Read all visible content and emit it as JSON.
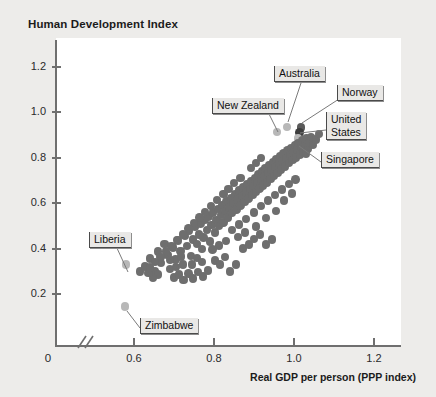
{
  "chart_data": {
    "type": "scatter",
    "title": "Human Development Index",
    "ylabel": "Human Development Index",
    "xlabel": "Real GDP per person (PPP index)",
    "xticks": [
      0.6,
      0.8,
      1.0,
      1.2
    ],
    "xtick_labels": [
      "0.6",
      "0.8",
      "1.0",
      "1.2"
    ],
    "x_origin_label": "0",
    "yticks": [
      0.2,
      0.4,
      0.6,
      0.8,
      1.0,
      1.2
    ],
    "ytick_labels": [
      "0.2",
      "0.4",
      "0.6",
      "0.8",
      "1.0",
      "1.2"
    ],
    "xlim": [
      0.52,
      1.3
    ],
    "ylim": [
      0.0,
      1.3
    ],
    "axis_break": true,
    "grid": false,
    "legend": "none",
    "marker_color": "#6e6e6e",
    "highlight_color": "#3d3d3d",
    "light_marker_color": "#b8b8b8",
    "annotations": [
      {
        "label": "Australia",
        "x": 0.983,
        "y": 0.936
      },
      {
        "label": "Norway",
        "x": 1.018,
        "y": 0.934
      },
      {
        "label": "New Zealand",
        "x": 0.957,
        "y": 0.914
      },
      {
        "label": "United States",
        "x": 1.013,
        "y": 0.913
      },
      {
        "label": "Singapore",
        "x": 1.01,
        "y": 0.885
      },
      {
        "label": "Liberia",
        "x": 0.58,
        "y": 0.33
      },
      {
        "label": "Zimbabwe",
        "x": 0.578,
        "y": 0.145
      }
    ],
    "points": [
      {
        "x": 0.58,
        "y": 0.33,
        "hl": "light"
      },
      {
        "x": 0.578,
        "y": 0.145,
        "hl": "light"
      },
      {
        "x": 0.983,
        "y": 0.936,
        "hl": "light"
      },
      {
        "x": 1.018,
        "y": 0.934,
        "hl": "dark"
      },
      {
        "x": 0.957,
        "y": 0.914,
        "hl": "light"
      },
      {
        "x": 1.013,
        "y": 0.913,
        "hl": "darker"
      },
      {
        "x": 1.01,
        "y": 0.885,
        "hl": "light"
      },
      {
        "x": 0.615,
        "y": 0.3
      },
      {
        "x": 0.628,
        "y": 0.322
      },
      {
        "x": 0.64,
        "y": 0.356
      },
      {
        "x": 0.652,
        "y": 0.3
      },
      {
        "x": 0.66,
        "y": 0.388
      },
      {
        "x": 0.668,
        "y": 0.336
      },
      {
        "x": 0.676,
        "y": 0.42
      },
      {
        "x": 0.684,
        "y": 0.372
      },
      {
        "x": 0.69,
        "y": 0.31
      },
      {
        "x": 0.698,
        "y": 0.404
      },
      {
        "x": 0.704,
        "y": 0.352
      },
      {
        "x": 0.71,
        "y": 0.436
      },
      {
        "x": 0.716,
        "y": 0.39
      },
      {
        "x": 0.722,
        "y": 0.33
      },
      {
        "x": 0.728,
        "y": 0.455
      },
      {
        "x": 0.733,
        "y": 0.412
      },
      {
        "x": 0.738,
        "y": 0.478
      },
      {
        "x": 0.742,
        "y": 0.368
      },
      {
        "x": 0.747,
        "y": 0.44
      },
      {
        "x": 0.752,
        "y": 0.495
      },
      {
        "x": 0.757,
        "y": 0.42
      },
      {
        "x": 0.762,
        "y": 0.463
      },
      {
        "x": 0.766,
        "y": 0.51
      },
      {
        "x": 0.77,
        "y": 0.398
      },
      {
        "x": 0.774,
        "y": 0.448
      },
      {
        "x": 0.778,
        "y": 0.528
      },
      {
        "x": 0.782,
        "y": 0.482
      },
      {
        "x": 0.786,
        "y": 0.542
      },
      {
        "x": 0.79,
        "y": 0.432
      },
      {
        "x": 0.794,
        "y": 0.505
      },
      {
        "x": 0.798,
        "y": 0.56
      },
      {
        "x": 0.802,
        "y": 0.47
      },
      {
        "x": 0.806,
        "y": 0.525
      },
      {
        "x": 0.81,
        "y": 0.575
      },
      {
        "x": 0.813,
        "y": 0.5
      },
      {
        "x": 0.817,
        "y": 0.548
      },
      {
        "x": 0.82,
        "y": 0.592
      },
      {
        "x": 0.824,
        "y": 0.515
      },
      {
        "x": 0.828,
        "y": 0.566
      },
      {
        "x": 0.831,
        "y": 0.608
      },
      {
        "x": 0.835,
        "y": 0.538
      },
      {
        "x": 0.838,
        "y": 0.582
      },
      {
        "x": 0.842,
        "y": 0.624
      },
      {
        "x": 0.845,
        "y": 0.556
      },
      {
        "x": 0.849,
        "y": 0.6
      },
      {
        "x": 0.852,
        "y": 0.64
      },
      {
        "x": 0.856,
        "y": 0.572
      },
      {
        "x": 0.859,
        "y": 0.616
      },
      {
        "x": 0.863,
        "y": 0.655
      },
      {
        "x": 0.866,
        "y": 0.59
      },
      {
        "x": 0.87,
        "y": 0.632
      },
      {
        "x": 0.873,
        "y": 0.67
      },
      {
        "x": 0.876,
        "y": 0.606
      },
      {
        "x": 0.88,
        "y": 0.648
      },
      {
        "x": 0.883,
        "y": 0.684
      },
      {
        "x": 0.886,
        "y": 0.62
      },
      {
        "x": 0.89,
        "y": 0.662
      },
      {
        "x": 0.893,
        "y": 0.698
      },
      {
        "x": 0.896,
        "y": 0.636
      },
      {
        "x": 0.899,
        "y": 0.676
      },
      {
        "x": 0.902,
        "y": 0.712
      },
      {
        "x": 0.905,
        "y": 0.65
      },
      {
        "x": 0.908,
        "y": 0.69
      },
      {
        "x": 0.911,
        "y": 0.726
      },
      {
        "x": 0.914,
        "y": 0.664
      },
      {
        "x": 0.917,
        "y": 0.704
      },
      {
        "x": 0.92,
        "y": 0.74
      },
      {
        "x": 0.923,
        "y": 0.678
      },
      {
        "x": 0.926,
        "y": 0.718
      },
      {
        "x": 0.929,
        "y": 0.754
      },
      {
        "x": 0.932,
        "y": 0.692
      },
      {
        "x": 0.935,
        "y": 0.732
      },
      {
        "x": 0.938,
        "y": 0.768
      },
      {
        "x": 0.941,
        "y": 0.706
      },
      {
        "x": 0.944,
        "y": 0.746
      },
      {
        "x": 0.947,
        "y": 0.782
      },
      {
        "x": 0.95,
        "y": 0.72
      },
      {
        "x": 0.953,
        "y": 0.76
      },
      {
        "x": 0.956,
        "y": 0.795
      },
      {
        "x": 0.959,
        "y": 0.734
      },
      {
        "x": 0.962,
        "y": 0.774
      },
      {
        "x": 0.965,
        "y": 0.808
      },
      {
        "x": 0.968,
        "y": 0.748
      },
      {
        "x": 0.971,
        "y": 0.788
      },
      {
        "x": 0.974,
        "y": 0.82
      },
      {
        "x": 0.977,
        "y": 0.762
      },
      {
        "x": 0.98,
        "y": 0.8
      },
      {
        "x": 0.984,
        "y": 0.832
      },
      {
        "x": 0.987,
        "y": 0.776
      },
      {
        "x": 0.99,
        "y": 0.812
      },
      {
        "x": 0.993,
        "y": 0.844
      },
      {
        "x": 0.996,
        "y": 0.79
      },
      {
        "x": 0.999,
        "y": 0.824
      },
      {
        "x": 1.002,
        "y": 0.856
      },
      {
        "x": 1.005,
        "y": 0.802
      },
      {
        "x": 1.008,
        "y": 0.836
      },
      {
        "x": 1.011,
        "y": 0.866
      },
      {
        "x": 1.015,
        "y": 0.814
      },
      {
        "x": 1.018,
        "y": 0.848
      },
      {
        "x": 1.021,
        "y": 0.876
      },
      {
        "x": 1.024,
        "y": 0.826
      },
      {
        "x": 1.028,
        "y": 0.858
      },
      {
        "x": 1.031,
        "y": 0.884
      },
      {
        "x": 1.035,
        "y": 0.838
      },
      {
        "x": 1.039,
        "y": 0.868
      },
      {
        "x": 1.043,
        "y": 0.892
      },
      {
        "x": 0.9,
        "y": 0.56
      },
      {
        "x": 0.918,
        "y": 0.588
      },
      {
        "x": 0.935,
        "y": 0.612
      },
      {
        "x": 0.952,
        "y": 0.636
      },
      {
        "x": 0.88,
        "y": 0.53
      },
      {
        "x": 0.862,
        "y": 0.506
      },
      {
        "x": 0.845,
        "y": 0.482
      },
      {
        "x": 0.97,
        "y": 0.66
      },
      {
        "x": 0.988,
        "y": 0.684
      },
      {
        "x": 1.004,
        "y": 0.705
      },
      {
        "x": 0.86,
        "y": 0.452
      },
      {
        "x": 0.878,
        "y": 0.47
      },
      {
        "x": 0.905,
        "y": 0.498
      },
      {
        "x": 0.83,
        "y": 0.434
      },
      {
        "x": 0.812,
        "y": 0.414
      },
      {
        "x": 0.796,
        "y": 0.396
      },
      {
        "x": 0.955,
        "y": 0.565
      },
      {
        "x": 0.93,
        "y": 0.534
      },
      {
        "x": 0.7,
        "y": 0.272
      },
      {
        "x": 0.712,
        "y": 0.286
      },
      {
        "x": 0.724,
        "y": 0.262
      },
      {
        "x": 0.736,
        "y": 0.29
      },
      {
        "x": 0.748,
        "y": 0.268
      },
      {
        "x": 0.76,
        "y": 0.296
      },
      {
        "x": 0.772,
        "y": 0.276
      },
      {
        "x": 0.785,
        "y": 0.304
      },
      {
        "x": 0.66,
        "y": 0.286
      },
      {
        "x": 0.648,
        "y": 0.27
      },
      {
        "x": 0.636,
        "y": 0.292
      },
      {
        "x": 0.69,
        "y": 0.35
      },
      {
        "x": 0.705,
        "y": 0.32
      },
      {
        "x": 0.718,
        "y": 0.365
      },
      {
        "x": 0.745,
        "y": 0.33
      },
      {
        "x": 0.758,
        "y": 0.358
      },
      {
        "x": 0.77,
        "y": 0.34
      },
      {
        "x": 0.802,
        "y": 0.348
      },
      {
        "x": 0.815,
        "y": 0.33
      },
      {
        "x": 0.828,
        "y": 0.362
      },
      {
        "x": 0.84,
        "y": 0.3
      },
      {
        "x": 0.855,
        "y": 0.33
      },
      {
        "x": 0.872,
        "y": 0.4
      },
      {
        "x": 0.888,
        "y": 0.418
      },
      {
        "x": 0.9,
        "y": 0.442
      },
      {
        "x": 0.915,
        "y": 0.462
      },
      {
        "x": 0.93,
        "y": 0.418
      },
      {
        "x": 0.945,
        "y": 0.44
      },
      {
        "x": 0.975,
        "y": 0.612
      },
      {
        "x": 0.995,
        "y": 0.642
      },
      {
        "x": 1.03,
        "y": 0.82
      },
      {
        "x": 1.048,
        "y": 0.856
      },
      {
        "x": 1.055,
        "y": 0.88
      },
      {
        "x": 1.062,
        "y": 0.905
      },
      {
        "x": 0.892,
        "y": 0.756
      },
      {
        "x": 0.905,
        "y": 0.778
      },
      {
        "x": 0.918,
        "y": 0.8
      },
      {
        "x": 0.866,
        "y": 0.712
      },
      {
        "x": 0.85,
        "y": 0.688
      },
      {
        "x": 0.836,
        "y": 0.662
      },
      {
        "x": 0.824,
        "y": 0.64
      },
      {
        "x": 0.808,
        "y": 0.614
      },
      {
        "x": 0.792,
        "y": 0.588
      },
      {
        "x": 0.778,
        "y": 0.562
      },
      {
        "x": 0.764,
        "y": 0.536
      },
      {
        "x": 0.75,
        "y": 0.512
      },
      {
        "x": 0.736,
        "y": 0.488
      },
      {
        "x": 0.722,
        "y": 0.462
      },
      {
        "x": 0.708,
        "y": 0.438
      },
      {
        "x": 0.694,
        "y": 0.412
      },
      {
        "x": 0.68,
        "y": 0.388
      },
      {
        "x": 0.666,
        "y": 0.362
      },
      {
        "x": 0.652,
        "y": 0.34
      },
      {
        "x": 0.64,
        "y": 0.316
      }
    ]
  }
}
